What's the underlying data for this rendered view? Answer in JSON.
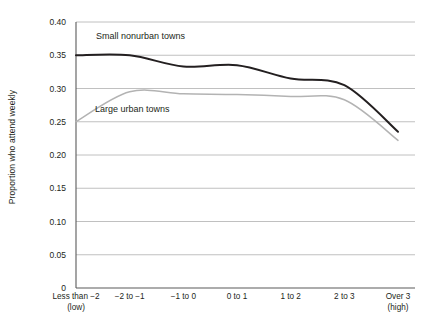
{
  "chart_data": {
    "type": "line",
    "title": "",
    "xlabel": "",
    "ylabel": "Proportion who attend weekly",
    "ylim": [
      0,
      0.4
    ],
    "ytick_labels": [
      "0.40",
      "0.35",
      "0.30",
      "0.25",
      "0.20",
      "0.15",
      "0.10",
      "0.05",
      "0"
    ],
    "ytick_values": [
      0.4,
      0.35,
      0.3,
      0.25,
      0.2,
      0.15,
      0.1,
      0.05,
      0
    ],
    "grid": true,
    "legend": "inline-labels",
    "categories": [
      "Less than −2\n(low)",
      "−2 to −1",
      "−1 to 0",
      "0 to 1",
      "1 to 2",
      "2 to 3",
      "Over 3\n(high)"
    ],
    "series": [
      {
        "name": "Small nonurban towns",
        "color": "#231f20",
        "values": [
          0.35,
          0.35,
          0.333,
          0.335,
          0.315,
          0.305,
          0.235
        ]
      },
      {
        "name": "Large urban towns",
        "color": "#b3b3b3",
        "values": [
          0.25,
          0.295,
          0.292,
          0.291,
          0.288,
          0.283,
          0.222
        ]
      }
    ],
    "annotations": [
      {
        "text": "Small nonurban towns",
        "series": "Small nonurban towns"
      },
      {
        "text": "Large urban towns",
        "series": "Large urban towns"
      }
    ]
  },
  "axis": {
    "y_title": "Proportion who attend weekly"
  },
  "colors": {
    "dark_series": "#231f20",
    "light_series": "#b3b3b3",
    "gridline": "#b9b9b9",
    "axis": "#5a5a5a",
    "text": "#231f20"
  }
}
